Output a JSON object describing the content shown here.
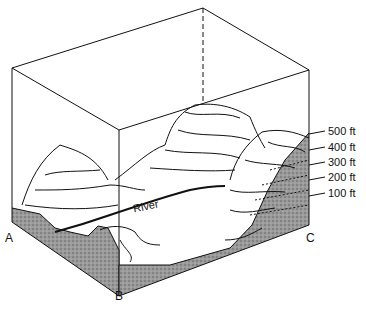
{
  "diagram": {
    "type": "block-diagram",
    "corner_labels": {
      "a": "A",
      "b": "B",
      "c": "C"
    },
    "river_label": "River",
    "elevation_labels": [
      "500 ft",
      "400 ft",
      "300 ft",
      "200 ft",
      "100 ft"
    ],
    "colors": {
      "line": "#111111",
      "shading": "#8a8a8a",
      "background": "#ffffff"
    }
  }
}
